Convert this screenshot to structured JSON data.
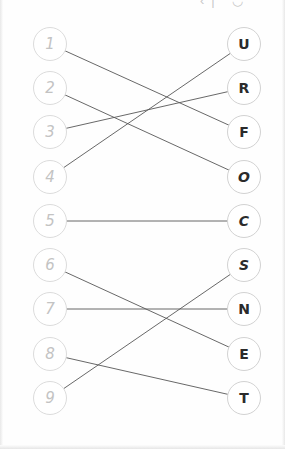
{
  "widget": {
    "name": "matching-exercise",
    "width": 285,
    "height": 449,
    "background_color": "#fefefe",
    "clipped_header_text": "‹| ◡"
  },
  "style": {
    "left_node_border_color": "#dcdcdc",
    "left_node_text_color": "#c3c3c3",
    "right_node_border_color": "#d2d2d2",
    "right_node_text_color": "#2b2b2b",
    "edge_color": "#575757",
    "node_radius": 17
  },
  "left_column": {
    "x": 50,
    "nodes": [
      {
        "id": "L1",
        "label": "1",
        "y": 44
      },
      {
        "id": "L2",
        "label": "2",
        "y": 88
      },
      {
        "id": "L3",
        "label": "3",
        "y": 132
      },
      {
        "id": "L4",
        "label": "4",
        "y": 177
      },
      {
        "id": "L5",
        "label": "5",
        "y": 221
      },
      {
        "id": "L6",
        "label": "6",
        "y": 265
      },
      {
        "id": "L7",
        "label": "7",
        "y": 309
      },
      {
        "id": "L8",
        "label": "8",
        "y": 354
      },
      {
        "id": "L9",
        "label": "9",
        "y": 398
      }
    ]
  },
  "right_column": {
    "x": 244,
    "nodes": [
      {
        "id": "R1",
        "label": "U",
        "y": 44,
        "italic": false
      },
      {
        "id": "R2",
        "label": "R",
        "y": 88,
        "italic": false
      },
      {
        "id": "R3",
        "label": "F",
        "y": 132,
        "italic": false
      },
      {
        "id": "R4",
        "label": "O",
        "y": 177,
        "italic": true
      },
      {
        "id": "R5",
        "label": "C",
        "y": 221,
        "italic": true
      },
      {
        "id": "R6",
        "label": "S",
        "y": 265,
        "italic": true
      },
      {
        "id": "R7",
        "label": "N",
        "y": 309,
        "italic": false
      },
      {
        "id": "R8",
        "label": "E",
        "y": 354,
        "italic": false
      },
      {
        "id": "R9",
        "label": "T",
        "y": 398,
        "italic": false
      }
    ]
  },
  "connections": [
    {
      "from": "1",
      "to": "F",
      "from_y": 44,
      "to_y": 132
    },
    {
      "from": "2",
      "to": "O",
      "from_y": 88,
      "to_y": 177
    },
    {
      "from": "3",
      "to": "R",
      "from_y": 132,
      "to_y": 88
    },
    {
      "from": "4",
      "to": "U",
      "from_y": 177,
      "to_y": 44
    },
    {
      "from": "5",
      "to": "C",
      "from_y": 221,
      "to_y": 221
    },
    {
      "from": "6",
      "to": "E",
      "from_y": 265,
      "to_y": 354
    },
    {
      "from": "7",
      "to": "N",
      "from_y": 309,
      "to_y": 309
    },
    {
      "from": "8",
      "to": "T",
      "from_y": 354,
      "to_y": 398
    },
    {
      "from": "9",
      "to": "S",
      "from_y": 398,
      "to_y": 265
    }
  ]
}
